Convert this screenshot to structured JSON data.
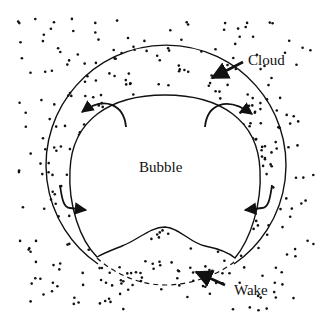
{
  "diagram": {
    "type": "bubble-cloud-wake schematic",
    "labels": {
      "bubble": "Bubble",
      "cloud": "Cloud",
      "wake": "Wake"
    },
    "colors": {
      "ink": "#111111",
      "background": "#ffffff",
      "particles": "#111111"
    },
    "arrows": [
      {
        "name": "cloud-pointer",
        "points_to": "cloud"
      },
      {
        "name": "wake-pointer",
        "points_to": "wake"
      },
      {
        "name": "circulation-top-left",
        "direction": "outward"
      },
      {
        "name": "circulation-top-right",
        "direction": "outward"
      },
      {
        "name": "inflow-lower-left",
        "direction": "inward"
      },
      {
        "name": "inflow-lower-right",
        "direction": "inward"
      }
    ]
  }
}
